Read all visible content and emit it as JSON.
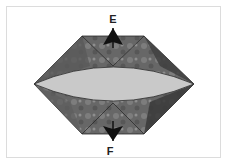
{
  "diagram": {
    "type": "folding-instruction",
    "labels": {
      "top": "E",
      "bottom": "F"
    },
    "colors": {
      "fabric_dark": "#4a4a4a",
      "fabric_mid": "#6e6e6e",
      "fabric_light": "#8a8a8a",
      "lens": "#c9c9c9",
      "arrow": "#111111",
      "frame_border": "#dcdcdc"
    }
  }
}
